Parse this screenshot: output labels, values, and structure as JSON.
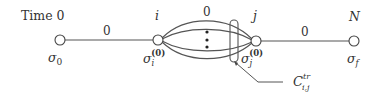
{
  "diagram": {
    "time_label": "Time 0",
    "time_markers": {
      "i": "i",
      "j": "j",
      "N": "N"
    },
    "nodes": [
      {
        "id": "sigma_0",
        "symbol": "σ",
        "sub": "0",
        "sup": ""
      },
      {
        "id": "sigma_i",
        "symbol": "σ",
        "sub": "i",
        "sup": "(0)"
      },
      {
        "id": "sigma_j",
        "symbol": "σ",
        "sub": "j",
        "sup": "(0)"
      },
      {
        "id": "sigma_f",
        "symbol": "σ",
        "sub": "f",
        "sup": ""
      }
    ],
    "edges": [
      {
        "from": "sigma_0",
        "to": "sigma_i",
        "label": "0"
      },
      {
        "from": "sigma_i",
        "to": "sigma_j",
        "label": "0",
        "type": "bundle",
        "ellipsis": "⋮"
      },
      {
        "from": "sigma_j",
        "to": "sigma_f",
        "label": "0"
      }
    ],
    "cut": {
      "symbol": "C",
      "sup": "tr",
      "sub": "i,j"
    }
  }
}
